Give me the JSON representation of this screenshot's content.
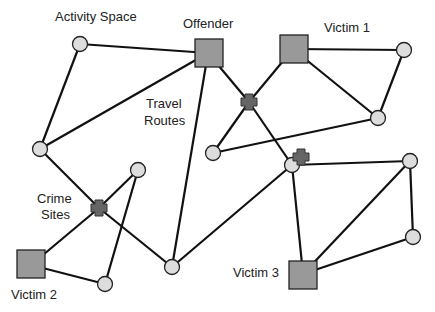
{
  "diagram": {
    "labels": {
      "activity_space": "Activity Space",
      "offender": "Offender",
      "victim1": "Victim 1",
      "travel_routes_line1": "Travel",
      "travel_routes_line2": "Routes",
      "crime_sites_line1": "Crime",
      "crime_sites_line2": "Sites",
      "victim2": "Victim 2",
      "victim3": "Victim 3"
    },
    "colors": {
      "square_fill": "#999999",
      "circle_fill": "#dddddd",
      "cross_fill": "#666666",
      "stroke": "#111111"
    },
    "legend_semantics": {
      "square": "person (offender / victim)",
      "circle": "activity space node",
      "cross": "crime site",
      "line": "travel route"
    }
  }
}
